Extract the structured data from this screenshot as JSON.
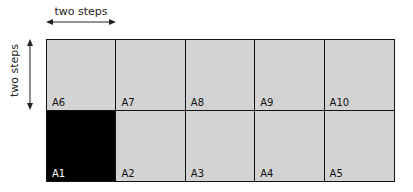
{
  "annotations": {
    "horizontal_label": "two steps",
    "vertical_label": "two steps"
  },
  "grid": {
    "rows": 2,
    "columns": 5,
    "cell_color": "#d3d3d3",
    "highlight_color": "#000000",
    "top_row": [
      {
        "label": "A6",
        "filled": false
      },
      {
        "label": "A7",
        "filled": false
      },
      {
        "label": "A8",
        "filled": false
      },
      {
        "label": "A9",
        "filled": false
      },
      {
        "label": "A10",
        "filled": false
      }
    ],
    "bottom_row": [
      {
        "label": "A1",
        "filled": true
      },
      {
        "label": "A2",
        "filled": false
      },
      {
        "label": "A3",
        "filled": false
      },
      {
        "label": "A4",
        "filled": false
      },
      {
        "label": "A5",
        "filled": false
      }
    ]
  }
}
